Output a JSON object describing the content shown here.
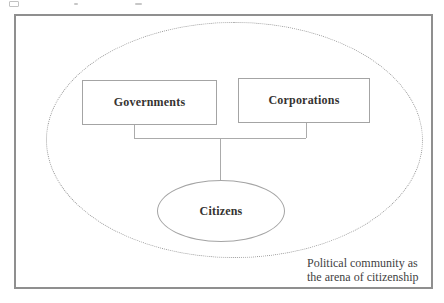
{
  "diagram": {
    "nodes": {
      "governments": {
        "label": "Governments"
      },
      "corporations": {
        "label": "Corporations"
      },
      "citizens": {
        "label": "Citizens"
      }
    },
    "caption": {
      "line1": "Political community as",
      "line2": "the arena of citizenship"
    },
    "colors": {
      "background": "#ffffff",
      "frame_border": "#8f8f8f",
      "node_border": "#a4a4a4",
      "connector": "#ababab",
      "boundary_dotted": "#9a9a9a",
      "label_text": "#363331",
      "caption_text": "#3f3f3f"
    }
  }
}
